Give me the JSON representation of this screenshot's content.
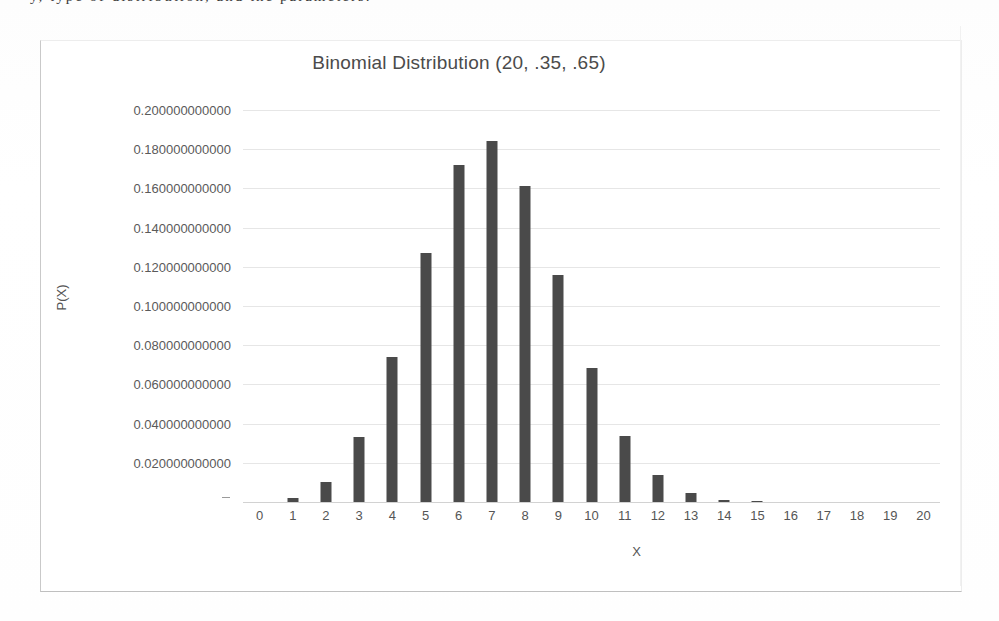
{
  "page": {
    "top_cut_text": "y, type of distribution, and the parameters."
  },
  "chart": {
    "title": "Binomial Distribution (20, .35, .65)",
    "y_axis_title": "P(X)",
    "x_axis_title": "X",
    "bar_color": "#4a4a4a",
    "gridline_color": "#e6e6e6",
    "axis_text_color": "#555555"
  },
  "chart_data": {
    "type": "bar",
    "title": "Binomial Distribution (20, .35, .65)",
    "xlabel": "X",
    "ylabel": "P(X)",
    "ylim": [
      0,
      0.2
    ],
    "grid": true,
    "legend": null,
    "categories": [
      "0",
      "1",
      "2",
      "3",
      "4",
      "5",
      "6",
      "7",
      "8",
      "9",
      "10",
      "11",
      "12",
      "13",
      "14",
      "15",
      "16",
      "17",
      "18",
      "19",
      "20"
    ],
    "values": [
      0.000177,
      0.002035,
      0.010406,
      0.033422,
      0.073801,
      0.126796,
      0.171727,
      0.184396,
      0.161347,
      0.115664,
      0.068594,
      0.033579,
      0.013566,
      0.004494,
      0.00121,
      0.000261,
      4.4e-05,
      6e-06,
      1e-06,
      0.0,
      0.0
    ],
    "ytick_labels": [
      "0.200000000000",
      "0.180000000000",
      "0.160000000000",
      "0.140000000000",
      "0.120000000000",
      "0.100000000000",
      "0.080000000000",
      "0.060000000000",
      "0.040000000000",
      "0.020000000000"
    ],
    "ytick_values": [
      0.2,
      0.18,
      0.16,
      0.14,
      0.12,
      0.1,
      0.08,
      0.06,
      0.04,
      0.02
    ],
    "xtick_labels": [
      "0",
      "1",
      "2",
      "3",
      "4",
      "5",
      "6",
      "7",
      "8",
      "9",
      "10",
      "11",
      "12",
      "13",
      "14",
      "15",
      "16",
      "17",
      "18",
      "19",
      "20"
    ]
  }
}
